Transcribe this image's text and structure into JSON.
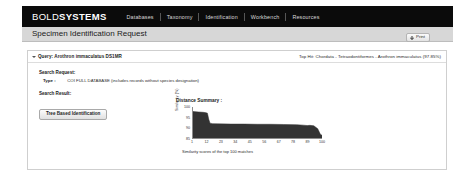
{
  "brand": {
    "light": "BOLD",
    "strong": "SYSTEMS"
  },
  "nav": {
    "items": [
      {
        "label": "Databases"
      },
      {
        "label": "Taxonomy"
      },
      {
        "label": "Identification"
      },
      {
        "label": "Workbench"
      },
      {
        "label": "Resources"
      }
    ]
  },
  "header": {
    "title": "Specimen Identification Request",
    "print_label": "Print",
    "print_icon": "printer-icon"
  },
  "query": {
    "toggle_icon": "chevron-down-icon",
    "label": "Query: Arothron immaculatus DS1MR",
    "top_hit": "Top Hit: Chordata - Tetraodontiformes - Arothron immaculatus (97.85%)"
  },
  "search_request": {
    "heading": "Search Request:",
    "type_key": "Type :",
    "type_value": "COI FULL DATABASE (includes records without species designation)"
  },
  "search_result": {
    "heading": "Search Result:",
    "tree_button_label": "Tree Based Identification"
  },
  "chart_data": {
    "type": "area",
    "title": "Distance Summary :",
    "caption": "Similarity scores of the top 100 matches",
    "xlabel": "",
    "ylabel": "Similarity (%)",
    "xlim": [
      1,
      100
    ],
    "ylim": [
      85,
      100
    ],
    "grid": false,
    "legend": null,
    "xticks": [
      1,
      12,
      23,
      34,
      45,
      56,
      67,
      78,
      89,
      100
    ],
    "yticks": [
      100,
      95,
      90,
      85
    ],
    "x": [
      1,
      5,
      9,
      11,
      12,
      13,
      14,
      16,
      20,
      30,
      40,
      50,
      60,
      70,
      80,
      85,
      88,
      90,
      93,
      96,
      98,
      100
    ],
    "values": [
      97.9,
      97.7,
      97.5,
      97.3,
      97.1,
      94.2,
      92.4,
      92.2,
      92.1,
      92.0,
      92.0,
      91.9,
      91.9,
      91.8,
      91.7,
      91.5,
      91.3,
      91.4,
      91.2,
      89.8,
      87.2,
      86.4
    ],
    "series": [
      {
        "name": "Similarity (%)",
        "values": [
          97.9,
          97.7,
          97.5,
          97.3,
          97.1,
          94.2,
          92.4,
          92.2,
          92.1,
          92.0,
          92.0,
          91.9,
          91.9,
          91.8,
          91.7,
          91.5,
          91.3,
          91.4,
          91.2,
          89.8,
          87.2,
          86.4
        ]
      }
    ],
    "fill_color": "#333333"
  },
  "colors": {
    "navbar_bg": "#0b0b0b",
    "titlebar_bg": "#d7d7d7",
    "panel_border": "#cfcfcf",
    "chart_fill": "#333333"
  }
}
